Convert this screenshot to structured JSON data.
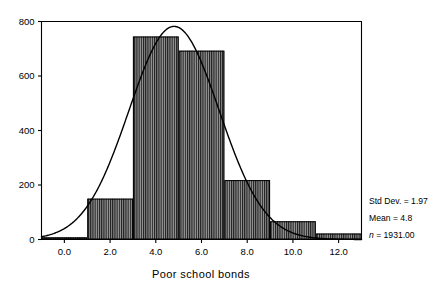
{
  "chart_data": {
    "type": "bar",
    "title": "",
    "xlabel": "Poor school bonds",
    "ylabel": "",
    "xlim": [
      -1,
      13
    ],
    "ylim": [
      0,
      800
    ],
    "bin_width": 2,
    "grid": false,
    "legend": "none",
    "categories": [
      "-1 to 1",
      "1 to 3",
      "3 to 5",
      "5 to 7",
      "7 to 9",
      "9 to 11",
      "11 to 13"
    ],
    "bin_starts": [
      -1,
      1,
      3,
      5,
      7,
      9,
      11
    ],
    "values": [
      8,
      150,
      745,
      693,
      218,
      67,
      22
    ],
    "xticks": [
      0,
      2,
      4,
      6,
      8,
      10,
      12
    ],
    "xtick_labels": [
      "0.0",
      "2.0",
      "4.0",
      "6.0",
      "8.0",
      "10.0",
      "12.0"
    ],
    "yticks": [
      0,
      200,
      400,
      600,
      800
    ],
    "ytick_labels": [
      "0",
      "200",
      "400",
      "600",
      "800"
    ],
    "overlay": {
      "type": "normal-curve",
      "mean": 4.8,
      "std_dev": 1.97,
      "n": 1931,
      "bin_width": 2
    },
    "annotations": [
      "Std Dev. = 1.97",
      "Mean = 4.8",
      "n = 1931.00"
    ],
    "colors": {
      "bar_fill": "#8a8a8a",
      "bar_hatch": "#1a1a1a",
      "bar_edge": "#000000",
      "curve": "#000000",
      "axis": "#000000",
      "background": "#ffffff"
    }
  },
  "stats_box": {
    "std_dev_label": "Std Dev. = 1.97",
    "mean_label": "Mean = 4.8",
    "n_prefix": "n",
    "n_value": " = 1931.00"
  },
  "axis": {
    "x_title": "Poor school bonds"
  }
}
